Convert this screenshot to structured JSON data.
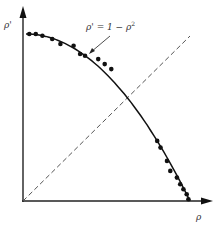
{
  "chart_data": {
    "type": "scatter",
    "title": "",
    "xlabel": "ρ",
    "ylabel": "ρ'",
    "xlim": [
      0,
      1.1
    ],
    "ylim": [
      0,
      1.15
    ],
    "grid": false,
    "legend": "none",
    "annotation": {
      "text": "ρ' = 1 − ρ²",
      "arrow_target": [
        0.55,
        0.7
      ]
    },
    "series": [
      {
        "name": "observed",
        "kind": "points",
        "x": [
          0.02,
          0.06,
          0.1,
          0.16,
          0.21,
          0.29,
          0.33,
          0.36,
          0.44,
          0.48,
          0.52,
          0.8,
          0.82,
          0.86,
          0.88,
          0.92,
          0.94,
          0.96,
          0.98,
          0.99
        ],
        "y": [
          1.0,
          1.0,
          0.99,
          0.97,
          0.94,
          0.93,
          0.88,
          0.87,
          0.85,
          0.82,
          0.79,
          0.36,
          0.32,
          0.24,
          0.18,
          0.14,
          0.1,
          0.07,
          0.04,
          0.01
        ]
      },
      {
        "name": "ρ' = 1 − ρ²",
        "kind": "curve",
        "x": [
          0.0,
          0.1,
          0.2,
          0.3,
          0.4,
          0.5,
          0.6,
          0.7,
          0.8,
          0.9,
          1.0
        ],
        "y": [
          1.0,
          0.99,
          0.96,
          0.91,
          0.84,
          0.75,
          0.64,
          0.51,
          0.36,
          0.19,
          0.0
        ]
      },
      {
        "name": "ρ' = ρ",
        "kind": "dashed-line",
        "x": [
          0.0,
          1.0
        ],
        "y": [
          0.0,
          1.0
        ]
      }
    ]
  },
  "labels": {
    "x_axis": "ρ",
    "y_axis": "ρ'",
    "annotation": "ρ' = 1 − ρ"
  },
  "colors": {
    "ink": "#111111",
    "dash": "#555555"
  }
}
